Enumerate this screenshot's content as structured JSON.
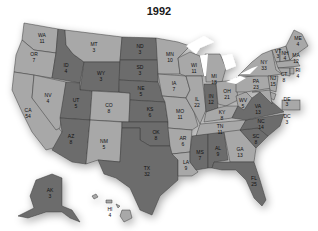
{
  "title": "1992",
  "colors": {
    "light": "#a8a8a8",
    "dark": "#6c6c6c",
    "lakes": "#ffffff",
    "background": "#ffffff"
  },
  "states": [
    {
      "abbr": "WA",
      "votes": "11",
      "shade": "light"
    },
    {
      "abbr": "OR",
      "votes": "7",
      "shade": "light"
    },
    {
      "abbr": "CA",
      "votes": "54",
      "shade": "light"
    },
    {
      "abbr": "NV",
      "votes": "4",
      "shade": "light"
    },
    {
      "abbr": "ID",
      "votes": "4",
      "shade": "dark"
    },
    {
      "abbr": "MT",
      "votes": "3",
      "shade": "light"
    },
    {
      "abbr": "WY",
      "votes": "3",
      "shade": "dark"
    },
    {
      "abbr": "UT",
      "votes": "5",
      "shade": "dark"
    },
    {
      "abbr": "AZ",
      "votes": "8",
      "shade": "dark"
    },
    {
      "abbr": "CO",
      "votes": "8",
      "shade": "light"
    },
    {
      "abbr": "NM",
      "votes": "5",
      "shade": "light"
    },
    {
      "abbr": "ND",
      "votes": "3",
      "shade": "dark"
    },
    {
      "abbr": "SD",
      "votes": "3",
      "shade": "dark"
    },
    {
      "abbr": "NE",
      "votes": "5",
      "shade": "dark"
    },
    {
      "abbr": "KS",
      "votes": "6",
      "shade": "dark"
    },
    {
      "abbr": "OK",
      "votes": "8",
      "shade": "dark"
    },
    {
      "abbr": "TX",
      "votes": "32",
      "shade": "dark"
    },
    {
      "abbr": "MN",
      "votes": "10",
      "shade": "light"
    },
    {
      "abbr": "IA",
      "votes": "7",
      "shade": "light"
    },
    {
      "abbr": "MO",
      "votes": "11",
      "shade": "light"
    },
    {
      "abbr": "AR",
      "votes": "6",
      "shade": "light"
    },
    {
      "abbr": "LA",
      "votes": "9",
      "shade": "light"
    },
    {
      "abbr": "WI",
      "votes": "11",
      "shade": "light"
    },
    {
      "abbr": "IL",
      "votes": "22",
      "shade": "light"
    },
    {
      "abbr": "MI",
      "votes": "18",
      "shade": "light"
    },
    {
      "abbr": "IN",
      "votes": "12",
      "shade": "dark"
    },
    {
      "abbr": "OH",
      "votes": "21",
      "shade": "light"
    },
    {
      "abbr": "KY",
      "votes": "8",
      "shade": "light"
    },
    {
      "abbr": "TN",
      "votes": "11",
      "shade": "light"
    },
    {
      "abbr": "MS",
      "votes": "7",
      "shade": "dark"
    },
    {
      "abbr": "AL",
      "votes": "9",
      "shade": "dark"
    },
    {
      "abbr": "GA",
      "votes": "13",
      "shade": "light"
    },
    {
      "abbr": "FL",
      "votes": "25",
      "shade": "dark"
    },
    {
      "abbr": "SC",
      "votes": "8",
      "shade": "dark"
    },
    {
      "abbr": "NC",
      "votes": "14",
      "shade": "dark"
    },
    {
      "abbr": "VA",
      "votes": "13",
      "shade": "dark"
    },
    {
      "abbr": "WV",
      "votes": "5",
      "shade": "light"
    },
    {
      "abbr": "PA",
      "votes": "23",
      "shade": "light"
    },
    {
      "abbr": "NY",
      "votes": "33",
      "shade": "light"
    },
    {
      "abbr": "VT",
      "votes": "3",
      "shade": "light"
    },
    {
      "abbr": "NH",
      "votes": "4",
      "shade": "light"
    },
    {
      "abbr": "ME",
      "votes": "4",
      "shade": "light"
    },
    {
      "abbr": "MA",
      "votes": "12",
      "shade": "light"
    },
    {
      "abbr": "RI",
      "votes": "4",
      "shade": "light"
    },
    {
      "abbr": "CT",
      "votes": "8",
      "shade": "light"
    },
    {
      "abbr": "NJ",
      "votes": "15",
      "shade": "light"
    },
    {
      "abbr": "DE",
      "votes": "3",
      "shade": "light"
    },
    {
      "abbr": "MD",
      "votes": "10",
      "shade": "light"
    },
    {
      "abbr": "DC",
      "votes": "3",
      "shade": "light"
    },
    {
      "abbr": "AK",
      "votes": "3",
      "shade": "dark"
    },
    {
      "abbr": "HI",
      "votes": "4",
      "shade": "light"
    }
  ]
}
